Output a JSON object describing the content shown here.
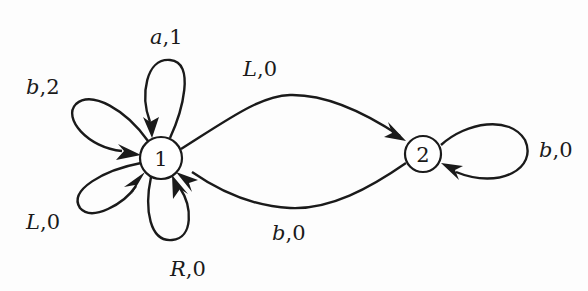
{
  "diagram": {
    "type": "state-transition-diagram",
    "nodes": [
      {
        "id": "1",
        "label": "1",
        "cx": 161,
        "cy": 158,
        "r": 21
      },
      {
        "id": "2",
        "label": "2",
        "cx": 423,
        "cy": 154,
        "r": 18
      }
    ],
    "edges": [
      {
        "from": "1",
        "to": "1",
        "symbol": "a",
        "output": "1",
        "label": "a,1"
      },
      {
        "from": "1",
        "to": "1",
        "symbol": "b",
        "output": "2",
        "label": "b,2"
      },
      {
        "from": "1",
        "to": "1",
        "symbol": "L",
        "output": "0",
        "label": "L,0"
      },
      {
        "from": "1",
        "to": "1",
        "symbol": "R",
        "output": "0",
        "label": "R,0"
      },
      {
        "from": "1",
        "to": "2",
        "symbol": "L",
        "output": "0",
        "label": "L,0"
      },
      {
        "from": "2",
        "to": "1",
        "symbol": "b",
        "output": "0",
        "label": "b,0"
      },
      {
        "from": "2",
        "to": "2",
        "symbol": "b",
        "output": "0",
        "label": "b,0"
      }
    ],
    "labels": {
      "loop_a1": {
        "sym": "a",
        "out": ",1"
      },
      "loop_b2": {
        "sym": "b",
        "out": ",2"
      },
      "loop_L0": {
        "sym": "L",
        "out": ",0"
      },
      "loop_R0": {
        "sym": "R",
        "out": ",0"
      },
      "edge_1_2": {
        "sym": "L",
        "out": ",0"
      },
      "edge_2_1": {
        "sym": "b",
        "out": ",0"
      },
      "loop_2_b0": {
        "sym": "b",
        "out": ",0"
      }
    },
    "colors": {
      "stroke": "#1a1a1a",
      "background": "#fdfdfd"
    }
  }
}
